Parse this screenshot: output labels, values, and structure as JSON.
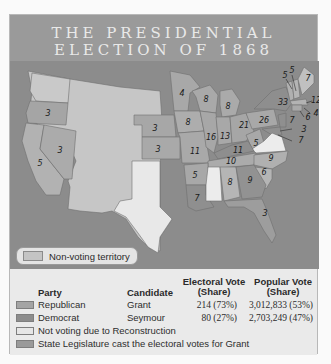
{
  "title": {
    "line1": "THE PRESIDENTIAL",
    "line2": "ELECTION OF 1868"
  },
  "map": {
    "inset_legend": {
      "label": "Non-voting territory",
      "swatch_color": "#c4c4c4"
    },
    "state_labels": [
      {
        "state": "Oregon",
        "ev": "3"
      },
      {
        "state": "California",
        "ev": "5"
      },
      {
        "state": "Nevada",
        "ev": "3"
      },
      {
        "state": "Minnesota",
        "ev": "4"
      },
      {
        "state": "Nebraska",
        "ev": "3"
      },
      {
        "state": "Kansas",
        "ev": "3"
      },
      {
        "state": "Iowa",
        "ev": "8"
      },
      {
        "state": "Missouri",
        "ev": "11"
      },
      {
        "state": "Wisconsin",
        "ev": "8"
      },
      {
        "state": "Michigan",
        "ev": "8"
      },
      {
        "state": "Illinois",
        "ev": "16"
      },
      {
        "state": "Indiana",
        "ev": "13"
      },
      {
        "state": "Ohio",
        "ev": "21"
      },
      {
        "state": "Pennsylvania",
        "ev": "26"
      },
      {
        "state": "New York",
        "ev": "33"
      },
      {
        "state": "Vermont",
        "ev": "5"
      },
      {
        "state": "New Hampshire",
        "ev": "5"
      },
      {
        "state": "Maine",
        "ev": "7"
      },
      {
        "state": "Massachusetts",
        "ev": "12"
      },
      {
        "state": "Rhode Island",
        "ev": "4"
      },
      {
        "state": "Connecticut",
        "ev": "6"
      },
      {
        "state": "New Jersey",
        "ev": "7"
      },
      {
        "state": "Delaware",
        "ev": "3"
      },
      {
        "state": "Maryland",
        "ev": "7"
      },
      {
        "state": "West Virginia",
        "ev": "5"
      },
      {
        "state": "Kentucky",
        "ev": "11"
      },
      {
        "state": "Tennessee",
        "ev": "10"
      },
      {
        "state": "North Carolina",
        "ev": "9"
      },
      {
        "state": "South Carolina",
        "ev": "6"
      },
      {
        "state": "Arkansas",
        "ev": "5"
      },
      {
        "state": "Louisiana",
        "ev": "7"
      },
      {
        "state": "Alabama",
        "ev": "8"
      },
      {
        "state": "Georgia",
        "ev": "9"
      },
      {
        "state": "Florida",
        "ev": "3"
      }
    ]
  },
  "legend": {
    "headers": {
      "party": "Party",
      "candidate": "Candidate",
      "electoral_line1": "Electoral Vote",
      "electoral_line2": "(Share)",
      "popular_line1": "Popular Vote",
      "popular_line2": "(Share)"
    },
    "rows": [
      {
        "swatch_color": "#a4a4a4",
        "party": "Republican",
        "candidate": "Grant",
        "electoral": "214 (73%)",
        "popular": "3,012,833 (53%)"
      },
      {
        "swatch_color": "#8c8c8c",
        "party": "Democrat",
        "candidate": "Seymour",
        "electoral": "80 (27%)",
        "popular": "2,703,249 (47%)"
      },
      {
        "swatch_color": "#e6e6e6",
        "party": "Not voting due to Reconstruction"
      },
      {
        "swatch_color": "#9a9a9a",
        "party": "State Legislature cast the electoral votes for Grant"
      }
    ]
  },
  "colors": {
    "republican": "#a8a8a8",
    "democrat": "#8f8f8f",
    "not_voting": "#ececec",
    "legislature": "#9c9c9c",
    "territory": "#c6c6c6",
    "water": "#8c8c8c"
  }
}
